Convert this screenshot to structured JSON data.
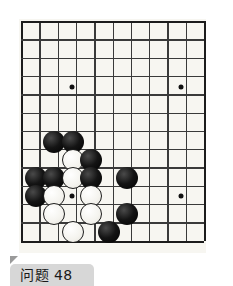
{
  "caption": {
    "label": "问题 48"
  },
  "board": {
    "title": "go-board",
    "origin_x": 21,
    "origin_y": 21,
    "spacing_x": 18.3,
    "spacing_y": 18.3,
    "cols": 11,
    "rows": 13,
    "line_color": "#3a3a3a",
    "edge_color": "#1c1c1c",
    "background_color": "#f7f6f1",
    "star_points": [
      {
        "x": 72,
        "y": 87
      },
      {
        "x": 181,
        "y": 87
      },
      {
        "x": 72,
        "y": 196
      },
      {
        "x": 181,
        "y": 196
      }
    ],
    "stone_radius": 11,
    "stones": [
      {
        "color": "black",
        "x": 54,
        "y": 142
      },
      {
        "color": "black",
        "x": 73,
        "y": 142
      },
      {
        "color": "white",
        "x": 73,
        "y": 160
      },
      {
        "color": "black",
        "x": 91,
        "y": 160
      },
      {
        "color": "black",
        "x": 36,
        "y": 178
      },
      {
        "color": "black",
        "x": 54,
        "y": 178
      },
      {
        "color": "white",
        "x": 73,
        "y": 178
      },
      {
        "color": "black",
        "x": 91,
        "y": 178
      },
      {
        "color": "black",
        "x": 127,
        "y": 178
      },
      {
        "color": "black",
        "x": 36,
        "y": 196
      },
      {
        "color": "white",
        "x": 54,
        "y": 196
      },
      {
        "color": "white",
        "x": 91,
        "y": 196
      },
      {
        "color": "white",
        "x": 54,
        "y": 214
      },
      {
        "color": "white",
        "x": 91,
        "y": 214
      },
      {
        "color": "black",
        "x": 127,
        "y": 214
      },
      {
        "color": "white",
        "x": 73,
        "y": 232
      },
      {
        "color": "black",
        "x": 109,
        "y": 232
      }
    ]
  }
}
